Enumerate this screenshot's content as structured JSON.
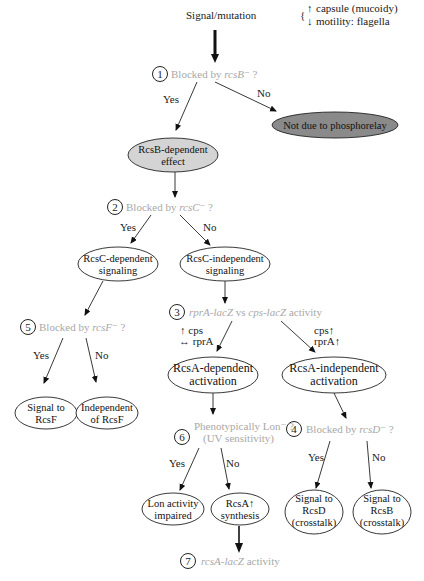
{
  "diagram": {
    "root": {
      "label": "Signal/mutation",
      "effects": [
        {
          "arrow": "↑",
          "text": "capsule (mucoidy)"
        },
        {
          "arrow": "↓",
          "text": "motility: flagella"
        }
      ]
    },
    "questions": {
      "q1": {
        "number": "1",
        "prefix": "Blocked by ",
        "gene": "rcsB",
        "suffix": "⁻ ?"
      },
      "q2": {
        "number": "2",
        "prefix": "Blocked by ",
        "gene": "rcsC",
        "suffix": "⁻ ?"
      },
      "q3": {
        "number": "3",
        "gene1": "rprA-lacZ",
        "mid": " vs ",
        "gene2": "cps-lacZ",
        "suffix": " activity"
      },
      "q4": {
        "number": "4",
        "prefix": "Blocked by ",
        "gene": "rcsD",
        "suffix": "⁻ ?"
      },
      "q5": {
        "number": "5",
        "prefix": "Blocked by ",
        "gene": "rcsF",
        "suffix": "⁻ ?"
      },
      "q6": {
        "number": "6",
        "line1": "Phenotypically Lon⁻ ?",
        "line2": "(UV sensitivity)"
      },
      "q7": {
        "number": "7",
        "gene": "rcsA-lacZ",
        "suffix": " activity"
      }
    },
    "edge_labels": {
      "yes": "Yes",
      "no": "No"
    },
    "q3_left_labels": {
      "line1": "↑ cps",
      "line2": "↔ rprA"
    },
    "q3_right_labels": {
      "line1": "cps↑",
      "line2": "rprA↑"
    },
    "nodes": {
      "rcsb_dependent": {
        "line1": "RcsB-dependent",
        "line2": "effect"
      },
      "not_phosphorelay": {
        "line1": "Not due to phosphorelay"
      },
      "rcsc_dependent": {
        "line1": "RcsC-dependent",
        "line2": "signaling"
      },
      "rcsc_independent": {
        "line1": "RcsC-independent",
        "line2": "signaling"
      },
      "rcsa_dependent": {
        "line1": "RcsA-dependent",
        "line2": "activation"
      },
      "rcsa_independent": {
        "line1": "RcsA-independent",
        "line2": "activation"
      },
      "signal_rcsf": {
        "line1": "Signal to",
        "line2": "RcsF"
      },
      "independent_rcsf": {
        "line1": "Independent",
        "line2": "of RcsF"
      },
      "lon_impaired": {
        "line1": "Lon activity",
        "line2": "impaired"
      },
      "rcsa_synthesis": {
        "line1": "RcsA↑",
        "line2": "synthesis"
      },
      "signal_rcsd": {
        "line1": "Signal to",
        "line2": "RcsD",
        "line3": "(crosstalk)"
      },
      "signal_rcsb": {
        "line1": "Signal to",
        "line2": "RcsB",
        "line3": "(crosstalk)"
      }
    },
    "colors": {
      "question_text": "#a8a8a8",
      "rcsb_fill": "#d4d4d4",
      "not_phosphorelay_fill": "#8a8a8a",
      "stroke": "#222222"
    }
  }
}
